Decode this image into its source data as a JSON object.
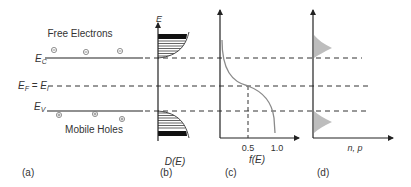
{
  "diagram": {
    "colors": {
      "line": "#222222",
      "curve": "#8a8a8a",
      "fill": "#bdbdbd",
      "text": "#333333"
    },
    "panel_a": {
      "caption": "(a)",
      "free_electrons_label": "Free Electrons",
      "mobile_holes_label": "Mobile Holes",
      "ec_label_main": "E",
      "ec_label_sub": "C",
      "ef_label_main": "E",
      "ef_label_sub": "F",
      "ef_equals": " = ",
      "ei_label_main": "E",
      "ei_label_sub": "i",
      "ev_label_main": "E",
      "ev_label_sub": "V",
      "electron_symbol": "⊖",
      "hole_symbol": "⊕"
    },
    "panel_b": {
      "caption": "(b)",
      "y_axis_label": "E",
      "x_axis_label": "D(E)"
    },
    "panel_c": {
      "caption": "(c)",
      "x_axis_label": "f(E)",
      "tick_0_5": "0.5",
      "tick_1_0": "1.0"
    },
    "panel_d": {
      "caption": "(d)",
      "x_axis_label": "n, p"
    }
  }
}
